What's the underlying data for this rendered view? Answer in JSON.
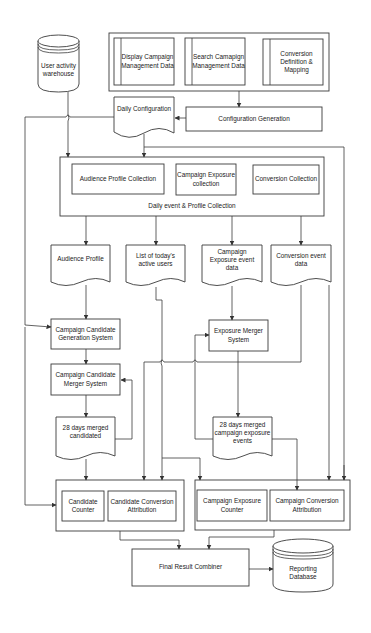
{
  "diagram": {
    "user_activity_warehouse": "User activity warehouse",
    "config_sources": {
      "display_campaign": "Display Campaign Management Data",
      "search_campaign": "Search Camapign Management Data",
      "conversion_definition": "Conversion Definition & Mapping"
    },
    "configuration_generation": "Configuration Generation",
    "daily_configuration": "Daily Configuration",
    "daily_collection": {
      "title": "Daily  event & Profile Collection",
      "audience_profile_collection": "Audience Profile Collection",
      "campaign_exposure_collection": "Campaign Exposure collection",
      "conversion_collection": "Conversion Collection"
    },
    "outputs": {
      "audience_profile": "Audience Profile",
      "active_users": "List of  today's active users",
      "campaign_exposure_event_data": "Campaign Exposure event data",
      "conversion_event_data": "Conversion event data"
    },
    "candidate_generation": "Campaign Candidate Generation System",
    "candidate_merger": "Campaign Candidate Merger  System",
    "merged_candidates": "28 days merged candidated",
    "exposure_merger": "Exposure Merger System",
    "merged_exposures": "28 days merged campaign exposure events",
    "candidate_group": {
      "candidate_counter": "Candidate Counter",
      "candidate_conversion_attribution": "Candidate Conversion Attribution"
    },
    "campaign_group": {
      "campaign_exposure_counter": "Campaign Exposure Counter",
      "campaign_conversion_attribution": "Campaign Conversion Attribution"
    },
    "final_result_combiner": "Final Result Combiner",
    "reporting_database": "Reporting Database"
  }
}
